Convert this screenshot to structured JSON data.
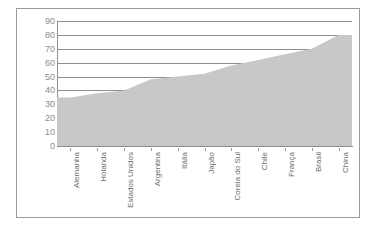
{
  "chart_data": {
    "type": "area",
    "title": "",
    "subtitle": "",
    "xlabel": "",
    "ylabel": "",
    "categories": [
      "Alemanha",
      "Holanda",
      "Estados Unidos",
      "Argentina",
      "Itália",
      "Japão",
      "Coreia do Sul",
      "Chile",
      "França",
      "Brasil",
      "China"
    ],
    "values": [
      35,
      38,
      40,
      48,
      50,
      52,
      58,
      62,
      66,
      70,
      80
    ],
    "ylim": [
      0,
      90
    ],
    "ytick_labels": [
      "90",
      "80",
      "70",
      "60",
      "50",
      "40",
      "30",
      "20",
      "10",
      "0"
    ],
    "ytick_values": [
      90,
      80,
      70,
      60,
      50,
      40,
      30,
      20,
      10,
      0
    ],
    "ytick_step": 10,
    "grid": true,
    "grid_axis": "y",
    "legend": false,
    "legend_position": "none",
    "series": [
      {
        "name": "",
        "values": [
          35,
          38,
          40,
          48,
          50,
          52,
          58,
          62,
          66,
          70,
          80
        ]
      }
    ],
    "colors": {
      "area_fill": "#c8c8c8",
      "gridline": "#8e8e8e",
      "axis": "#8e8e8e",
      "frame_border": "#9a9a9a",
      "tick_label": "#8c8c8c",
      "category_label": "#6d6d6d",
      "background": "#ffffff"
    }
  }
}
